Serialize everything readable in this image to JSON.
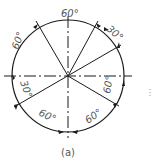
{
  "figure": {
    "caption": "(a)",
    "center": [
      68,
      76
    ],
    "radius": 56,
    "stroke_color": "#1a1a1a",
    "text_color": "#555555"
  },
  "angle_labels": [
    {
      "text": "60°",
      "position": "top"
    },
    {
      "text": "30°",
      "position": "upper-right"
    },
    {
      "text": "60°",
      "position": "right"
    },
    {
      "text": "60°",
      "position": "lower-right"
    },
    {
      "text": "60°",
      "position": "lower-left"
    },
    {
      "text": "30°",
      "position": "left"
    },
    {
      "text": "60°",
      "position": "upper-left"
    }
  ],
  "radial_lines_deg": [
    120,
    60,
    30,
    210,
    330
  ],
  "centerlines": [
    "horizontal",
    "vertical"
  ]
}
